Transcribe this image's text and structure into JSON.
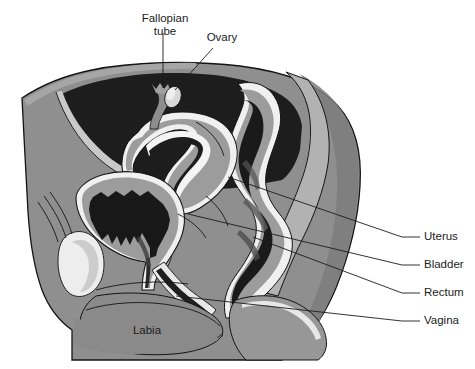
{
  "figure": {
    "background_color": "#ffffff",
    "width": 475,
    "height": 369
  },
  "palette": {
    "background": "#ffffff",
    "body_tissue": "#8f8f8f",
    "body_tissue_dark": "#7a7a7a",
    "skin_edge": "#a3a3a3",
    "cavity_dark": "#1d1d1d",
    "cavity_black": "#141414",
    "organ_wall": "#9c9c9c",
    "organ_wall_light": "#b4b4b4",
    "highlight_white": "#f2f2f2",
    "bone_white": "#ededed",
    "outline": "#141414",
    "label_text": "#1c1c1c",
    "leader_line": "#1c1c1c"
  },
  "labels": [
    {
      "id": "fallopian-tube",
      "text_line_1": "Fallopian",
      "text_line_2": "tube",
      "x": 165,
      "y": 22,
      "anchor": "middle",
      "two_line": true
    },
    {
      "id": "ovary",
      "text_line_1": "Ovary",
      "text_line_2": "",
      "x": 222,
      "y": 41,
      "anchor": "middle",
      "two_line": false
    },
    {
      "id": "labia",
      "text_line_1": "Labia",
      "text_line_2": "",
      "x": 147,
      "y": 334,
      "anchor": "middle",
      "two_line": false
    },
    {
      "id": "uterus",
      "text_line_1": "Uterus",
      "text_line_2": "",
      "x": 424,
      "y": 240,
      "anchor": "start",
      "two_line": false
    },
    {
      "id": "bladder",
      "text_line_1": "Bladder",
      "text_line_2": "",
      "x": 424,
      "y": 268,
      "anchor": "start",
      "two_line": false
    },
    {
      "id": "rectum",
      "text_line_1": "Rectum",
      "text_line_2": "",
      "x": 424,
      "y": 296,
      "anchor": "start",
      "two_line": false
    },
    {
      "id": "vagina",
      "text_line_1": "Vagina",
      "text_line_2": "",
      "x": 424,
      "y": 324,
      "anchor": "start",
      "two_line": false
    }
  ],
  "leaders": [
    {
      "id": "leader-fallopian-tube",
      "d": "M 163 33 L 163 88"
    },
    {
      "id": "leader-ovary",
      "d": "M 213 48 L 175 90"
    },
    {
      "id": "leader-uterus",
      "d": "M 228 177 L 402 237 L 420 237"
    },
    {
      "id": "leader-bladder",
      "d": "M 188 214 L 402 265 L 420 265"
    },
    {
      "id": "leader-rectum",
      "d": "M 253 237 L 402 293 L 420 293"
    },
    {
      "id": "leader-vagina",
      "d": "M 176 296 L 402 321 L 420 321"
    }
  ],
  "anatomy_parts": [
    {
      "id": "body-torso",
      "name": "torso-outline"
    },
    {
      "id": "abdominal-cavity",
      "name": "abdominal-cavity"
    },
    {
      "id": "uterus-body",
      "name": "uterus"
    },
    {
      "id": "uterus-cavity",
      "name": "uterine-cavity"
    },
    {
      "id": "bladder-body",
      "name": "bladder"
    },
    {
      "id": "bladder-lumen",
      "name": "bladder-lumen"
    },
    {
      "id": "rectum-body",
      "name": "rectum"
    },
    {
      "id": "rectum-lumen",
      "name": "rectal-lumen"
    },
    {
      "id": "vagina-canal",
      "name": "vaginal-canal"
    },
    {
      "id": "pubic-bone",
      "name": "pubic-bone"
    },
    {
      "id": "sacrum",
      "name": "sacrum"
    },
    {
      "id": "ovary-part",
      "name": "ovary"
    },
    {
      "id": "fallopian-tube-part",
      "name": "fallopian-tube"
    },
    {
      "id": "labia-part",
      "name": "labia"
    },
    {
      "id": "thigh",
      "name": "thigh"
    },
    {
      "id": "buttock",
      "name": "buttock"
    }
  ]
}
